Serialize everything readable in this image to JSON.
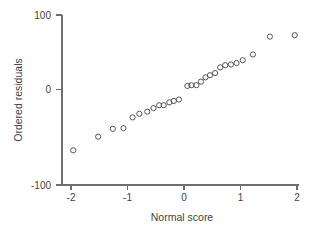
{
  "chart_data": {
    "type": "scatter",
    "title": "",
    "xlabel": "Normal score",
    "ylabel": "Ordered residuals",
    "xlim": [
      -2.15,
      2.15
    ],
    "ylim": [
      -125,
      100
    ],
    "xticks": [
      -2,
      -1,
      0,
      1,
      2
    ],
    "xticklabels": [
      "-2",
      "-1",
      "0",
      "1",
      "2"
    ],
    "yticks": [
      -100,
      0,
      100
    ],
    "yticklabels": [
      "-100",
      "0",
      "100"
    ],
    "grid": false,
    "legend": null,
    "marker": "open-circle",
    "marker_color": "#555555",
    "axis_color": "#6e6e6e",
    "background": "#ffffff",
    "points": [
      {
        "x": -1.96,
        "y": -85
      },
      {
        "x": -1.52,
        "y": -66
      },
      {
        "x": -1.26,
        "y": -55
      },
      {
        "x": -1.07,
        "y": -54
      },
      {
        "x": -0.91,
        "y": -39
      },
      {
        "x": -0.79,
        "y": -34
      },
      {
        "x": -0.65,
        "y": -31
      },
      {
        "x": -0.54,
        "y": -26
      },
      {
        "x": -0.44,
        "y": -22
      },
      {
        "x": -0.36,
        "y": -22
      },
      {
        "x": -0.26,
        "y": -18
      },
      {
        "x": -0.18,
        "y": -16
      },
      {
        "x": -0.09,
        "y": -14
      },
      {
        "x": 0.06,
        "y": 5
      },
      {
        "x": 0.13,
        "y": 6
      },
      {
        "x": 0.22,
        "y": 6
      },
      {
        "x": 0.3,
        "y": 11
      },
      {
        "x": 0.38,
        "y": 17
      },
      {
        "x": 0.46,
        "y": 20
      },
      {
        "x": 0.55,
        "y": 23
      },
      {
        "x": 0.64,
        "y": 31
      },
      {
        "x": 0.73,
        "y": 34
      },
      {
        "x": 0.83,
        "y": 35
      },
      {
        "x": 0.93,
        "y": 37
      },
      {
        "x": 1.04,
        "y": 41
      },
      {
        "x": 1.22,
        "y": 49
      },
      {
        "x": 1.52,
        "y": 74
      },
      {
        "x": 1.96,
        "y": 76
      }
    ]
  },
  "axis_titles": {
    "x": "Normal score",
    "y": "Ordered residuals"
  }
}
